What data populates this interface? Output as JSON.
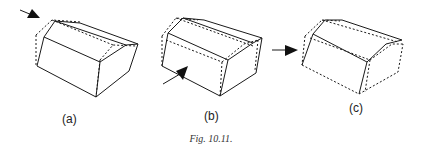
{
  "figure": {
    "caption": "Fig. 10.11.",
    "panels": [
      {
        "id": "a",
        "label": "(a)",
        "force_direction": "top-left corner, pointing down-right"
      },
      {
        "id": "b",
        "label": "(b)",
        "force_direction": "front face, pointing up-right"
      },
      {
        "id": "c",
        "label": "(c)",
        "force_direction": "left side, pointing right"
      }
    ],
    "legend": {
      "solid_lines": "deformed shape",
      "dashed_lines": "original shape"
    }
  }
}
